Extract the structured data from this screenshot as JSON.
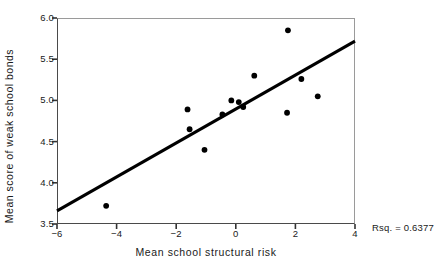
{
  "chart_data": {
    "type": "scatter",
    "title": "",
    "xlabel": "Mean school structural risk",
    "ylabel": "Mean score of weak school bonds",
    "xlim": [
      -6,
      4
    ],
    "ylim": [
      3.5,
      6.0
    ],
    "xticks": [
      "-6",
      "-4",
      "-2",
      "0",
      "2",
      "4"
    ],
    "xtick_values": [
      -6,
      -4,
      -2,
      0,
      2,
      4
    ],
    "yticks": [
      "6.0",
      "5.5",
      "5.0",
      "4.5",
      "4.0",
      "3.5"
    ],
    "ytick_values": [
      6.0,
      5.5,
      5.0,
      4.5,
      4.0,
      3.5
    ],
    "grid": false,
    "legend": "none",
    "marker_color": "#000000",
    "line_color": "#000000",
    "points": [
      {
        "x": -4.35,
        "y": 3.72
      },
      {
        "x": -1.62,
        "y": 4.89
      },
      {
        "x": -1.55,
        "y": 4.65
      },
      {
        "x": -1.05,
        "y": 4.4
      },
      {
        "x": -0.45,
        "y": 4.83
      },
      {
        "x": -0.15,
        "y": 5.0
      },
      {
        "x": 0.1,
        "y": 4.98
      },
      {
        "x": 0.25,
        "y": 4.92
      },
      {
        "x": 0.62,
        "y": 5.3
      },
      {
        "x": 1.75,
        "y": 5.85
      },
      {
        "x": 1.72,
        "y": 4.85
      },
      {
        "x": 2.2,
        "y": 5.26
      },
      {
        "x": 2.75,
        "y": 5.05
      }
    ],
    "fit_line": {
      "x_start": -6,
      "y_start": 3.66,
      "x_end": 4,
      "y_end": 5.72,
      "slope": 0.206,
      "intercept": 4.9
    },
    "annotations": [
      {
        "name": "rsq",
        "text": "Rsq. = 0.6377",
        "value": 0.6377
      }
    ]
  }
}
